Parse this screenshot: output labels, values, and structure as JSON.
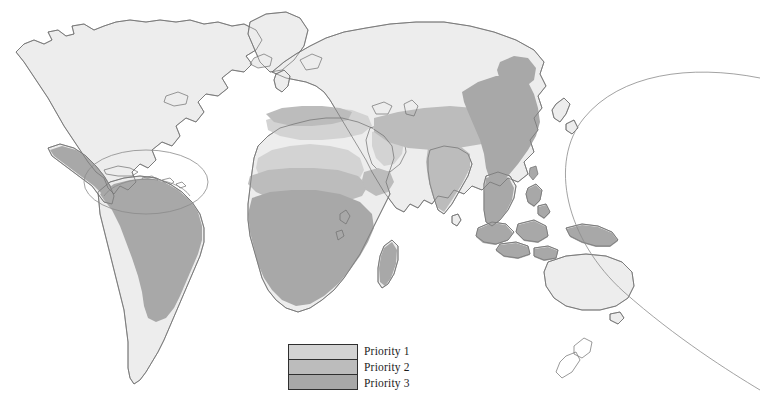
{
  "figure": {
    "type": "thematic-world-map",
    "background_color": "#ffffff",
    "width": 760,
    "height": 409,
    "projection_note": "world map with Caribbean inset ellipse and Pacific arc boundary"
  },
  "legend": {
    "name": "priority-legend",
    "border_color": "#2f2f2f",
    "items": [
      {
        "label": "Priority 1",
        "color": "#d3d3d3"
      },
      {
        "label": "Priority 2",
        "color": "#bcbcbc"
      },
      {
        "label": "Priority 3",
        "color": "#a8a8a8"
      }
    ]
  },
  "map": {
    "colors": {
      "land_unshaded": "#ededed",
      "priority1": "#d3d3d3",
      "priority2": "#bcbcbc",
      "priority3": "#a8a8a8",
      "coastline": "#6e6e6e",
      "inset_outline": "#8a8a8a"
    },
    "regions": [
      {
        "name": "north-america",
        "shading": "land_unshaded"
      },
      {
        "name": "greenland",
        "shading": "land_unshaded"
      },
      {
        "name": "mexico-central-america",
        "shading": "priority3"
      },
      {
        "name": "caribbean-inset",
        "shading": "inset-ellipse"
      },
      {
        "name": "south-america",
        "shading": "priority3"
      },
      {
        "name": "southern-cone",
        "shading": "land_unshaded"
      },
      {
        "name": "northern-europe-russia",
        "shading": "land_unshaded"
      },
      {
        "name": "mediterranean-southern-europe",
        "shading": "priority1"
      },
      {
        "name": "sahara",
        "shading": "priority1"
      },
      {
        "name": "sahel",
        "shading": "priority2"
      },
      {
        "name": "sub-saharan-africa",
        "shading": "priority3"
      },
      {
        "name": "southern-africa",
        "shading": "land_unshaded"
      },
      {
        "name": "madagascar",
        "shading": "priority3"
      },
      {
        "name": "arabian-peninsula",
        "shading": "priority1"
      },
      {
        "name": "middle-east-central-asia",
        "shading": "priority2"
      },
      {
        "name": "indian-subcontinent",
        "shading": "priority2"
      },
      {
        "name": "china-east-asia",
        "shading": "priority3"
      },
      {
        "name": "southeast-asia-indonesia",
        "shading": "priority3"
      },
      {
        "name": "philippines",
        "shading": "priority3"
      },
      {
        "name": "new-guinea",
        "shading": "priority3"
      },
      {
        "name": "australia",
        "shading": "land_unshaded"
      },
      {
        "name": "new-zealand",
        "shading": "land_unshaded"
      },
      {
        "name": "japan",
        "shading": "land_unshaded"
      },
      {
        "name": "pacific-arc",
        "shading": "inset-arc"
      }
    ]
  }
}
